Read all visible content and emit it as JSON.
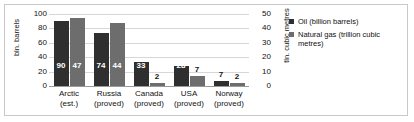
{
  "chart_data": {
    "type": "bar",
    "title": "",
    "categories": [
      "Arctic (est.)",
      "Russia (proved)",
      "Canada (proved)",
      "USA (proved)",
      "Norway (proved)"
    ],
    "category_lines": [
      [
        "Arctic",
        "(est.)"
      ],
      [
        "Russia",
        "(proved)"
      ],
      [
        "Canada",
        "(proved)"
      ],
      [
        "USA",
        "(proved)"
      ],
      [
        "Norway",
        "(proved)"
      ]
    ],
    "series": [
      {
        "name": "Oil (billion barrels)",
        "axis": "left",
        "color": "#2f2f2f",
        "values": [
          90,
          74,
          33,
          28,
          7
        ],
        "labels": [
          "90",
          "74",
          "33",
          "28",
          "7"
        ]
      },
      {
        "name": "Natural gas (trillion cubic metres)",
        "axis": "right",
        "color": "#6d6d6d",
        "values": [
          47,
          44,
          2,
          7,
          2
        ],
        "labels": [
          "47",
          "44",
          "2",
          "7",
          "2"
        ]
      }
    ],
    "xlabel": "",
    "ylabel_left": "bln. barrels",
    "ylabel_right": "tln. cubic metres",
    "ylim_left": [
      0,
      100
    ],
    "ylim_right": [
      0,
      50
    ],
    "yticks_left": [
      "0",
      "20",
      "40",
      "60",
      "80",
      "100"
    ],
    "yticks_right": [
      "0",
      "10",
      "20",
      "30",
      "40",
      "50"
    ],
    "grid": true,
    "legend_position": "right"
  },
  "legend": {
    "items": [
      {
        "label": "Oil (billion barrels)",
        "color": "#2f2f2f"
      },
      {
        "label": "Natural gas (trillion cubic metres)",
        "color": "#6d6d6d"
      }
    ]
  }
}
